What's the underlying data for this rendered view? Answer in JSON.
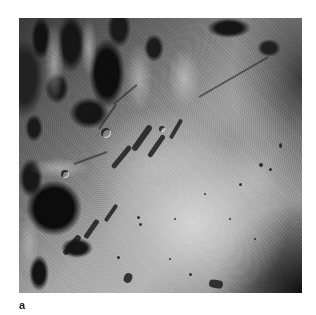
{
  "figure": {
    "panel_label": "a",
    "image": {
      "subject": "grayscale lunar surface photograph",
      "description": "Rugged dark highland terrain at top-left and left, smooth bright mare plain in center-bottom, sinuous rille along the highland edge, linear rille upper right, dark vignette at bottom-right"
    },
    "colors": {
      "background": "#ffffff",
      "label": "#222222"
    }
  }
}
